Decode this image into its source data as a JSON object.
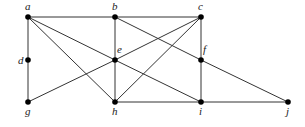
{
  "diagram": {
    "type": "graph",
    "nodes": [
      {
        "id": "a",
        "label": "a",
        "x": 28,
        "y": 17,
        "lx": 25,
        "ly": 10
      },
      {
        "id": "b",
        "label": "b",
        "x": 115,
        "y": 17,
        "lx": 112,
        "ly": 10
      },
      {
        "id": "c",
        "label": "c",
        "x": 201,
        "y": 17,
        "lx": 198,
        "ly": 10
      },
      {
        "id": "d",
        "label": "d",
        "x": 28,
        "y": 60,
        "lx": 18,
        "ly": 64
      },
      {
        "id": "e",
        "label": "e",
        "x": 115,
        "y": 60,
        "lx": 117,
        "ly": 53
      },
      {
        "id": "f",
        "label": "f",
        "x": 201,
        "y": 60,
        "lx": 203,
        "ly": 53
      },
      {
        "id": "g",
        "label": "g",
        "x": 28,
        "y": 102,
        "lx": 25,
        "ly": 115
      },
      {
        "id": "h",
        "label": "h",
        "x": 115,
        "y": 102,
        "lx": 112,
        "ly": 115
      },
      {
        "id": "i",
        "label": "i",
        "x": 201,
        "y": 102,
        "lx": 199,
        "ly": 115
      },
      {
        "id": "j",
        "label": "j",
        "x": 288,
        "y": 102,
        "lx": 286,
        "ly": 115
      }
    ],
    "edges": [
      [
        "a",
        "b"
      ],
      [
        "b",
        "c"
      ],
      [
        "a",
        "d"
      ],
      [
        "d",
        "g"
      ],
      [
        "a",
        "e"
      ],
      [
        "e",
        "i"
      ],
      [
        "a",
        "h"
      ],
      [
        "b",
        "e"
      ],
      [
        "e",
        "h"
      ],
      [
        "b",
        "f"
      ],
      [
        "f",
        "j"
      ],
      [
        "g",
        "e"
      ],
      [
        "e",
        "c"
      ],
      [
        "h",
        "c"
      ],
      [
        "c",
        "f"
      ],
      [
        "f",
        "i"
      ],
      [
        "h",
        "i"
      ],
      [
        "i",
        "j"
      ]
    ]
  }
}
